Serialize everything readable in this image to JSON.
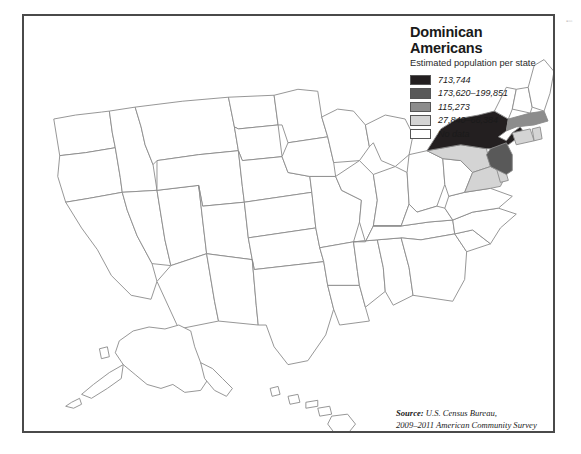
{
  "map": {
    "title_line1": "Dominican",
    "title_line2": "Americans",
    "subtitle": "Estimated population per state",
    "legend": [
      {
        "label": "713,744",
        "color": "#231f20"
      },
      {
        "label": "173,620–199,851",
        "color": "#595959"
      },
      {
        "label": "115,273",
        "color": "#8c8c8c"
      },
      {
        "label": "27,840–66,384",
        "color": "#d4d4d4"
      },
      {
        "label": "No data",
        "color": "#ffffff"
      }
    ],
    "source": {
      "lead": "Source:",
      "line1": " U.S. Census Bureau,",
      "line2": "2009–2011 American Community Survey"
    },
    "frame_color": "#4a4a4a",
    "state_outline_color": "#8a8a8a",
    "background": "#ffffff",
    "edge_marks": "▪▫▫",
    "states": [
      {
        "code": "NY",
        "name": "New York",
        "class": "tier1"
      },
      {
        "code": "FL",
        "name": "Florida",
        "class": "tier2"
      },
      {
        "code": "NJ",
        "name": "New Jersey",
        "class": "tier2"
      },
      {
        "code": "MA",
        "name": "Massachusetts",
        "class": "tier3"
      },
      {
        "code": "PA",
        "name": "Pennsylvania",
        "class": "tier4"
      },
      {
        "code": "RI",
        "name": "Rhode Island",
        "class": "tier4"
      },
      {
        "code": "CT",
        "name": "Connecticut",
        "class": "tier4"
      }
    ]
  }
}
